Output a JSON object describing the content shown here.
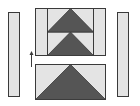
{
  "diagram": {
    "colors": {
      "light_fabric": "#e4e4e4",
      "dark_fabric": "#555555",
      "outline": "#3a3a3a",
      "background": "#ffffff"
    },
    "pieces": [
      {
        "id": "left-side-strip",
        "shape": "rectangle"
      },
      {
        "id": "top-flying-geese-unit-1",
        "shape": "triangle-in-rectangle"
      },
      {
        "id": "top-flying-geese-unit-2",
        "shape": "triangle-in-rectangle"
      },
      {
        "id": "top-left-column-strip",
        "shape": "rectangle"
      },
      {
        "id": "top-right-column-strip",
        "shape": "rectangle"
      },
      {
        "id": "bottom-large-triangle-unit",
        "shape": "triangle-in-rectangle"
      },
      {
        "id": "right-side-strip",
        "shape": "rectangle"
      }
    ],
    "arrow": {
      "direction": "up",
      "icon": "arrow-up-icon"
    }
  }
}
